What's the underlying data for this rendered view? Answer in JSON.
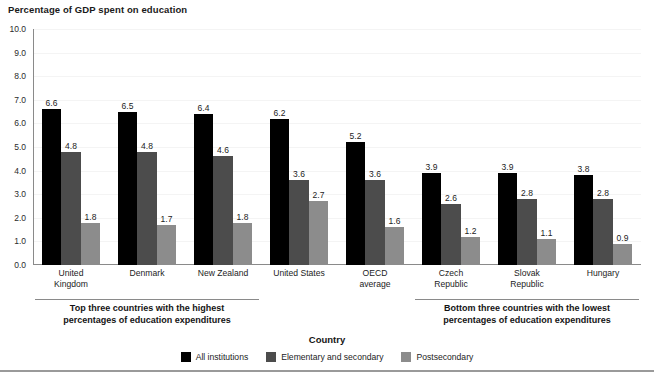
{
  "chart_data": {
    "type": "bar",
    "title": "Percentage of GDP spent on education",
    "xlabel": "Country",
    "ylabel": "",
    "ylim": [
      0.0,
      10.0
    ],
    "ytick_step": 1.0,
    "grid": true,
    "legend_position": "bottom-center",
    "categories": [
      "United Kingdom",
      "Denmark",
      "New Zealand",
      "United States",
      "OECD average",
      "Czech Republic",
      "Slovak Republic",
      "Hungary"
    ],
    "category_lines": [
      [
        "United",
        "Kingdom"
      ],
      [
        "Denmark"
      ],
      [
        "New Zealand"
      ],
      [
        "United States"
      ],
      [
        "OECD",
        "average"
      ],
      [
        "Czech",
        "Republic"
      ],
      [
        "Slovak",
        "Republic"
      ],
      [
        "Hungary"
      ]
    ],
    "ytick_labels": [
      "10.0",
      "9.0",
      "8.0",
      "7.0",
      "6.0",
      "5.0",
      "4.0",
      "3.0",
      "2.0",
      "1.0",
      "0.0"
    ],
    "ytick_values": [
      10.0,
      9.0,
      8.0,
      7.0,
      6.0,
      5.0,
      4.0,
      3.0,
      2.0,
      1.0,
      0.0
    ],
    "series": [
      {
        "name": "All institutions",
        "color": "#000000",
        "values": [
          6.6,
          6.5,
          6.4,
          6.2,
          5.2,
          3.9,
          3.9,
          3.8
        ],
        "labels": [
          "6.6",
          "6.5",
          "6.4",
          "6.2",
          "5.2",
          "3.9",
          "3.9",
          "3.8"
        ]
      },
      {
        "name": "Elementary and secondary",
        "color": "#4c4c4c",
        "values": [
          4.8,
          4.8,
          4.6,
          3.6,
          3.6,
          2.6,
          2.8,
          2.8
        ],
        "labels": [
          "4.8",
          "4.8",
          "4.6",
          "3.6",
          "3.6",
          "2.6",
          "2.8",
          "2.8"
        ]
      },
      {
        "name": "Postsecondary",
        "color": "#8c8c8c",
        "values": [
          1.8,
          1.7,
          1.8,
          2.7,
          1.6,
          1.2,
          1.1,
          0.9
        ],
        "labels": [
          "1.8",
          "1.7",
          "1.8",
          "2.7",
          "1.6",
          "1.2",
          "1.1",
          "0.9"
        ]
      }
    ],
    "annotations": [
      {
        "id": "top-three",
        "lines": [
          "Top three countries with the highest",
          "percentages of education expenditures"
        ],
        "covers": [
          "United Kingdom",
          "Denmark",
          "New Zealand"
        ]
      },
      {
        "id": "bottom-three",
        "lines": [
          "Bottom three countries with the lowest",
          "percentages of education expenditures"
        ],
        "covers": [
          "Czech Republic",
          "Slovak Republic",
          "Hungary"
        ]
      }
    ]
  }
}
